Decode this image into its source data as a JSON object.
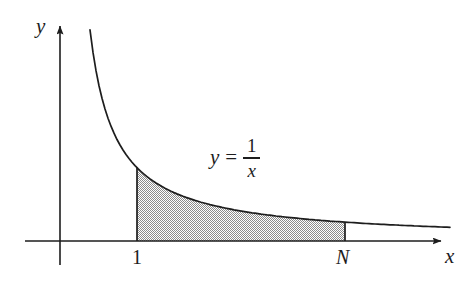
{
  "figure": {
    "background_color": "#ffffff",
    "ink_color": "#1d1d1d",
    "shade_color": "#9a9a9a",
    "width": 476,
    "height": 284
  },
  "axes": {
    "y_axis_label": "y",
    "x_axis_label": "x",
    "origin_px": {
      "x": 60,
      "y": 241
    },
    "y_axis_top_px": 22,
    "y_axis_bottom_px": 265,
    "x_axis_left_px": 25,
    "x_axis_right_px": 448
  },
  "ticks": [
    {
      "label": "1",
      "x_px": 137
    },
    {
      "label": "N",
      "x_px": 345
    }
  ],
  "formula": {
    "lhs": "y",
    "equals": "=",
    "numerator": "1",
    "denominator": "x"
  },
  "chart_data": {
    "type": "line",
    "title": "",
    "subtitle": "",
    "xlabel": "x",
    "ylabel": "y",
    "grid": false,
    "legend": false,
    "annotations": [
      {
        "text": "y = 1/x",
        "role": "curve-equation-label"
      },
      {
        "text": "1",
        "role": "x-tick-label"
      },
      {
        "text": "N",
        "role": "x-tick-label"
      }
    ],
    "series": [
      {
        "name": "y = 1/x",
        "function": "1/x",
        "x": [
          0.27,
          0.3,
          0.34,
          0.38,
          0.43,
          0.49,
          0.56,
          0.64,
          0.74,
          0.85,
          1.0,
          1.2,
          1.45,
          1.75,
          2.1,
          2.55,
          3.05,
          3.65,
          4.35,
          5.15,
          6.05,
          7.05,
          8.2,
          9.45,
          10.85,
          12.4,
          14.1,
          16.0
        ],
        "y": [
          3.7,
          3.33,
          2.94,
          2.63,
          2.33,
          2.04,
          1.79,
          1.56,
          1.35,
          1.18,
          1.0,
          0.83,
          0.69,
          0.57,
          0.48,
          0.39,
          0.33,
          0.27,
          0.23,
          0.19,
          0.17,
          0.14,
          0.12,
          0.11,
          0.09,
          0.08,
          0.07,
          0.06
        ]
      }
    ],
    "shaded_region": {
      "label": "area under y = 1/x from 1 to N",
      "x_from": "1",
      "x_to": "N",
      "fill": "hatched-gray"
    },
    "xlim": [
      "0",
      "beyond N"
    ],
    "ylim": [
      "0",
      "unbounded"
    ]
  }
}
